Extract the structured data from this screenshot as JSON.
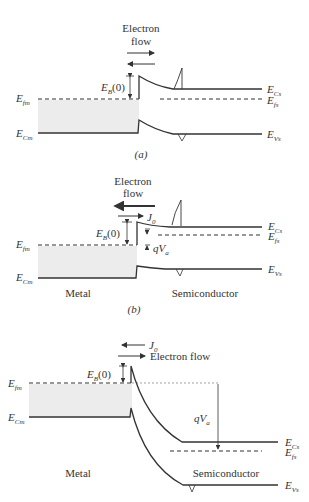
{
  "panels": [
    {
      "id": "a",
      "caption": "(a)",
      "flow_title_1": "Electron",
      "flow_title_2": "flow",
      "barrier_label": "E",
      "barrier_sub": "B",
      "barrier_arg": "(0)",
      "left_labels": [
        {
          "main": "E",
          "sub": "fm"
        },
        {
          "main": "E",
          "sub": "Cm"
        }
      ],
      "right_labels": [
        {
          "main": "E",
          "sub": "Cs"
        },
        {
          "main": "E",
          "sub": "fs"
        },
        {
          "main": "E",
          "sub": "Vs"
        }
      ]
    },
    {
      "id": "b",
      "caption": "(b)",
      "flow_title_1": "Electron",
      "flow_title_2": "flow",
      "current_label": "J",
      "current_sub": "0",
      "barrier_label": "E",
      "barrier_sub": "B",
      "barrier_arg": "(0)",
      "voltage_label": "qV",
      "voltage_sub": "a",
      "metal_label": "Metal",
      "semi_label": "Semiconductor",
      "left_labels": [
        {
          "main": "E",
          "sub": "fm"
        },
        {
          "main": "E",
          "sub": "Cm"
        }
      ],
      "right_labels": [
        {
          "main": "E",
          "sub": "Cs"
        },
        {
          "main": "E",
          "sub": "fs"
        },
        {
          "main": "E",
          "sub": "Vs"
        }
      ]
    },
    {
      "id": "c",
      "current_label": "J",
      "current_sub": "0",
      "flow_label": "Electron flow",
      "barrier_label": "E",
      "barrier_sub": "B",
      "barrier_arg": "(0)",
      "voltage_label": "qV",
      "voltage_sub": "a",
      "metal_label": "Metal",
      "semi_label": "Semiconductor",
      "left_labels": [
        {
          "main": "E",
          "sub": "fm"
        },
        {
          "main": "E",
          "sub": "Cm"
        }
      ],
      "right_labels": [
        {
          "main": "E",
          "sub": "Cs"
        },
        {
          "main": "E",
          "sub": "fs"
        },
        {
          "main": "E",
          "sub": "Vs"
        }
      ]
    }
  ],
  "colors": {
    "line": "#333333",
    "fill": "#ececec"
  }
}
